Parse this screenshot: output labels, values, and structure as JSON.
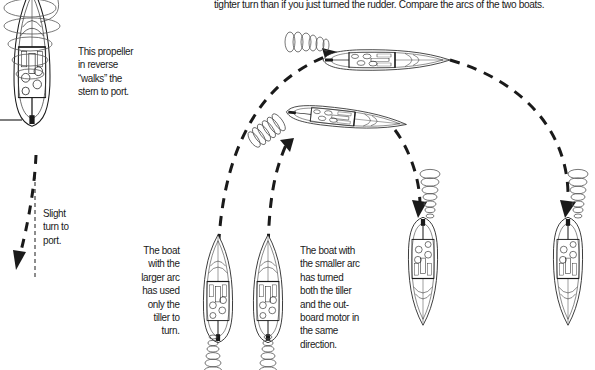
{
  "caption": {
    "top_line": "tighter turn than if you just turned the rudder. Compare the arcs of the two boats."
  },
  "labels": {
    "prop_walk": [
      "This propeller",
      "in reverse",
      "“walks” the",
      "stern to port."
    ],
    "slight_turn": [
      "Slight",
      "turn to",
      "port."
    ],
    "larger_arc": [
      "The boat",
      "with the",
      "larger arc",
      "has used",
      "only the",
      "tiller to",
      "turn."
    ],
    "smaller_arc": [
      "The boat with",
      "the smaller arc",
      "has turned",
      "both the tiller",
      "and the out-",
      "board motor in",
      "the same",
      "direction."
    ]
  },
  "diagram": {
    "boats": [
      {
        "name": "reversing-boat",
        "heading": "bow-up",
        "x": 30,
        "y": 0
      },
      {
        "name": "large-arc-start",
        "heading": "bow-up",
        "x": 218,
        "y": 320
      },
      {
        "name": "small-arc-start",
        "heading": "bow-up",
        "x": 268,
        "y": 320
      },
      {
        "name": "small-arc-mid",
        "heading": "bow-right",
        "x": 360,
        "y": 120
      },
      {
        "name": "large-arc-mid",
        "heading": "bow-right",
        "x": 400,
        "y": 60
      },
      {
        "name": "small-arc-end",
        "heading": "bow-down",
        "x": 425,
        "y": 290
      },
      {
        "name": "large-arc-end",
        "heading": "bow-down",
        "x": 570,
        "y": 290
      }
    ],
    "colors": {
      "line": "#1a1a1a",
      "prop_wash": "#555555",
      "background": "#ffffff"
    }
  }
}
